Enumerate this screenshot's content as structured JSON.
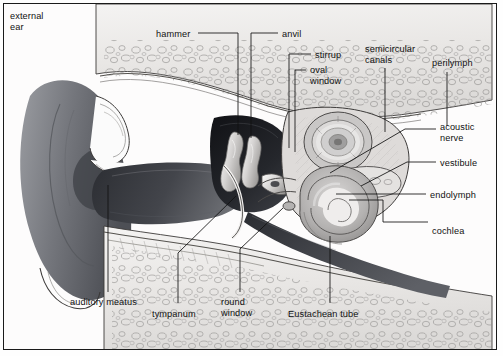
{
  "figure": {
    "type": "anatomical-diagram",
    "style": "grayscale halftone line illustration",
    "border_color": "#1a1a1a",
    "background": "#fefefe",
    "text_color": "#111111"
  },
  "labels": [
    {
      "id": "external-ear",
      "text": "external\near",
      "x": 10,
      "y": 11,
      "align": "left"
    },
    {
      "id": "hammer",
      "text": "hammer",
      "x": 156,
      "y": 29,
      "align": "left"
    },
    {
      "id": "anvil",
      "text": "anvil",
      "x": 282,
      "y": 29,
      "align": "left"
    },
    {
      "id": "stirrup",
      "text": "stirrup",
      "x": 315,
      "y": 50,
      "align": "left"
    },
    {
      "id": "oval-window",
      "text": "oval\nwindow",
      "x": 310,
      "y": 65,
      "align": "left"
    },
    {
      "id": "semicircular-canals",
      "text": "semicircular\ncanals",
      "x": 365,
      "y": 44,
      "align": "left"
    },
    {
      "id": "perilymph",
      "text": "perilymph",
      "x": 432,
      "y": 58,
      "align": "left"
    },
    {
      "id": "acoustic-nerve",
      "text": "acoustic\nnerve",
      "x": 440,
      "y": 122,
      "align": "left"
    },
    {
      "id": "vestibule",
      "text": "vestibule",
      "x": 440,
      "y": 158,
      "align": "left"
    },
    {
      "id": "endolymph",
      "text": "endolymph",
      "x": 430,
      "y": 190,
      "align": "left"
    },
    {
      "id": "cochlea",
      "text": "cochlea",
      "x": 432,
      "y": 226,
      "align": "left"
    },
    {
      "id": "auditory-meatus",
      "text": "auditory meatus",
      "x": 70,
      "y": 297,
      "align": "left"
    },
    {
      "id": "tympanum",
      "text": "tympanum",
      "x": 152,
      "y": 309,
      "align": "left"
    },
    {
      "id": "round-window",
      "text": "round\nwindow",
      "x": 221,
      "y": 297,
      "align": "left"
    },
    {
      "id": "eustachean-tube",
      "text": "Eustachean tube",
      "x": 288,
      "y": 309,
      "align": "left"
    }
  ],
  "leader_lines": [
    {
      "id": "leader-hammer",
      "points": "198,33 238,33 238,135"
    },
    {
      "id": "leader-anvil",
      "points": "278,33 251,33 251,138"
    },
    {
      "id": "leader-stirrup",
      "points": "311,54 289,54 289,148"
    },
    {
      "id": "leader-oval-window",
      "points": "306,70 295,70 295,152"
    },
    {
      "id": "leader-semicircular-canals",
      "points": "385,68 385,132"
    },
    {
      "id": "leader-perilymph",
      "points": "447,72 447,126"
    },
    {
      "id": "leader-acoustic-nerve",
      "points": "436,129 405,129 330,173"
    },
    {
      "id": "leader-vestibule",
      "points": "436,162 407,162 361,186"
    },
    {
      "id": "leader-endolymph",
      "points": "426,194 336,194"
    },
    {
      "id": "leader-cochlea",
      "points": "428,222 383,222 383,200 349,200"
    },
    {
      "id": "leader-auditory-meatus",
      "points": "108,292 108,185"
    },
    {
      "id": "leader-tympanum",
      "points": "178,303 178,253 236,196"
    },
    {
      "id": "leader-round-window",
      "points": "240,292 240,249 283,208"
    },
    {
      "id": "leader-eustachean-tube",
      "points": "330,303 330,236"
    }
  ],
  "regions": [
    {
      "id": "pinna",
      "name": "external ear (pinna)",
      "tone": "#6f7176"
    },
    {
      "id": "auditory-canal",
      "name": "auditory meatus canal",
      "tone": "#3a3c41"
    },
    {
      "id": "tympanic-cavity",
      "name": "middle ear cavity",
      "tone": "#1f2126"
    },
    {
      "id": "temporal-bone",
      "name": "temporal bone (cancellous)",
      "tone": "#eceaea"
    },
    {
      "id": "cochlea-spiral",
      "name": "cochlea",
      "tone": "#b9b7b7"
    },
    {
      "id": "eustachean-canal",
      "name": "Eustachean tube",
      "tone": "#4a4c51"
    }
  ]
}
